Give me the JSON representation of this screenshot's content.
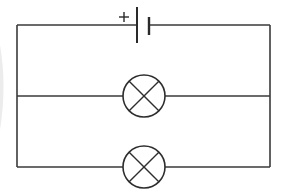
{
  "diagram": {
    "type": "circuit",
    "components": [
      {
        "id": "cell",
        "kind": "battery-cell",
        "label": "+",
        "polarity_marker": "+",
        "position": "top branch, center-left"
      },
      {
        "id": "lamp-1",
        "kind": "lamp",
        "position": "middle branch, center"
      },
      {
        "id": "lamp-2",
        "kind": "lamp",
        "position": "bottom branch, center"
      }
    ],
    "branches": [
      {
        "name": "top",
        "contains": [
          "cell"
        ]
      },
      {
        "name": "middle",
        "contains": [
          "lamp-1"
        ]
      },
      {
        "name": "bottom",
        "contains": [
          "lamp-2"
        ]
      }
    ],
    "colors": {
      "line": "#333333",
      "background": "#ffffff"
    }
  },
  "labels": {
    "plus_sign": "+"
  }
}
